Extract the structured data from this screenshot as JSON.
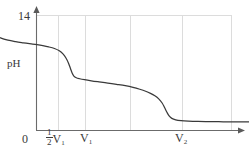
{
  "chart_data": {
    "type": "line",
    "title": "",
    "subtitle": "",
    "xlabel": "",
    "ylabel": "pH",
    "y_max_label": "14",
    "grid": true,
    "grid_style": "vertical gridlines at half-V1, V1, midpoint, V2 and right border; one horizontal gridline at pH 14 level",
    "legend": "none",
    "axis_arrows": {
      "x": true,
      "y": true
    },
    "xlim": [
      0,
      1.35
    ],
    "ylim": [
      0,
      14
    ],
    "x_ticks": [
      {
        "label": "0",
        "value": 0
      },
      {
        "label": "1/2 V1",
        "value": 0.5
      },
      {
        "label": "V1",
        "value": 1.0
      },
      {
        "label": "V2",
        "value": 2.0
      }
    ],
    "y_ticks": [
      {
        "label": "14",
        "value": 14
      }
    ],
    "annotations": [
      {
        "text": "pH",
        "role": "y-axis-title"
      },
      {
        "text": "14",
        "role": "y-axis-max"
      },
      {
        "text": "0",
        "role": "origin"
      },
      {
        "text": "1/2 V1",
        "role": "half-first-equivalence"
      },
      {
        "text": "V1",
        "role": "first-equivalence-volume"
      },
      {
        "text": "V2",
        "role": "second-equivalence-volume"
      }
    ],
    "series": [
      {
        "name": "pH titration curve",
        "color": "#3a3a3a",
        "points": [
          [
            0.0,
            13.2
          ],
          [
            0.02,
            12.6
          ],
          [
            0.045,
            12.05
          ],
          [
            0.08,
            11.6
          ],
          [
            0.13,
            11.25
          ],
          [
            0.2,
            11.0
          ],
          [
            0.28,
            10.82
          ],
          [
            0.36,
            10.68
          ],
          [
            0.44,
            10.55
          ],
          [
            0.5,
            10.45
          ],
          [
            0.56,
            10.33
          ],
          [
            0.62,
            10.18
          ],
          [
            0.68,
            9.98
          ],
          [
            0.73,
            9.7
          ],
          [
            0.77,
            9.3
          ],
          [
            0.8,
            8.8
          ],
          [
            0.825,
            8.2
          ],
          [
            0.845,
            7.55
          ],
          [
            0.862,
            7.0
          ],
          [
            0.88,
            6.62
          ],
          [
            0.905,
            6.42
          ],
          [
            0.94,
            6.3
          ],
          [
            0.99,
            6.18
          ],
          [
            1.06,
            6.05
          ],
          [
            1.14,
            5.92
          ],
          [
            1.23,
            5.78
          ],
          [
            1.32,
            5.62
          ],
          [
            1.41,
            5.45
          ],
          [
            1.49,
            5.25
          ],
          [
            1.56,
            5.02
          ],
          [
            1.62,
            4.78
          ],
          [
            1.67,
            4.52
          ],
          [
            1.715,
            4.22
          ],
          [
            1.755,
            3.85
          ],
          [
            1.79,
            3.35
          ],
          [
            1.815,
            2.8
          ],
          [
            1.838,
            2.25
          ],
          [
            1.862,
            1.78
          ],
          [
            1.89,
            1.48
          ],
          [
            1.93,
            1.3
          ],
          [
            1.985,
            1.2
          ],
          [
            2.06,
            1.14
          ],
          [
            2.16,
            1.1
          ],
          [
            2.28,
            1.08
          ],
          [
            2.42,
            1.06
          ],
          [
            2.56,
            1.05
          ],
          [
            2.7,
            1.04
          ]
        ]
      }
    ],
    "colors": {
      "curve": "#3a3a3a",
      "axis": "#6b6b6b",
      "grid": "#d9d9d9",
      "text": "#3a3a3a",
      "background": "#ffffff"
    }
  },
  "labels": {
    "y_max": "14",
    "y_title": "pH",
    "x_zero": "0",
    "x_half_v1_num": "1",
    "x_half_v1_den": "2",
    "x_half_v1_var": "V",
    "x_half_v1_sub": "1",
    "x_v1_var": "V",
    "x_v1_sub": "1",
    "x_v2_var": "V",
    "x_v2_sub": "2"
  }
}
